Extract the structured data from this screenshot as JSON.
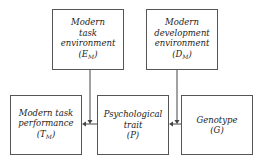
{
  "diagram": {
    "nodes": {
      "task_env": {
        "lines": [
          "Modern",
          "task",
          "environment"
        ],
        "symbol": "E",
        "subscript": "M"
      },
      "dev_env": {
        "lines": [
          "Modern",
          "development",
          "environment"
        ],
        "symbol": "D",
        "subscript": "M"
      },
      "task_perf": {
        "lines": [
          "Modern task",
          "performance"
        ],
        "symbol": "T",
        "subscript": "M"
      },
      "trait": {
        "lines": [
          "Psychological",
          "trait"
        ],
        "symbol": "P",
        "subscript": ""
      },
      "genotype": {
        "lines": [
          "Genotype"
        ],
        "symbol": "G",
        "subscript": ""
      }
    },
    "edges": [
      {
        "from": "trait",
        "to": "task_perf",
        "moderated_by": "task_env"
      },
      {
        "from": "genotype",
        "to": "trait",
        "moderated_by": "dev_env"
      }
    ]
  }
}
